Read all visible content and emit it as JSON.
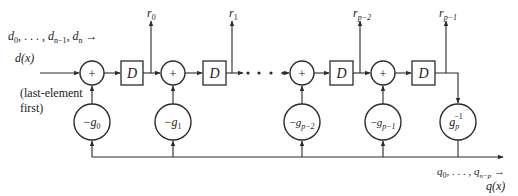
{
  "diagram": {
    "type": "polynomial-division-circuit",
    "input": {
      "sequence_label": "d0, ..., dn−1, dn →",
      "seq": {
        "d0": "d",
        "d0_sub": "0",
        "dots": ", . . . , ",
        "dn1": "d",
        "dn1_sub": "n−1",
        "comma": ", ",
        "dn": "d",
        "dn_sub": "n",
        "arrow": " →"
      },
      "poly_label": "d(x)",
      "note_line1": "(last-element",
      "note_line2": "first)"
    },
    "adders": [
      {
        "symbol": "+"
      },
      {
        "symbol": "+"
      },
      {
        "symbol": "+"
      },
      {
        "symbol": "+"
      }
    ],
    "delays": [
      {
        "symbol": "D"
      },
      {
        "symbol": "D"
      },
      {
        "symbol": "D"
      },
      {
        "symbol": "D"
      }
    ],
    "outputs": [
      {
        "base": "r",
        "sub": "0"
      },
      {
        "base": "r",
        "sub": "1"
      },
      {
        "base": "r",
        "sub": "p−2"
      },
      {
        "base": "r",
        "sub": "p−1"
      }
    ],
    "multipliers": [
      {
        "prefix": "−",
        "base": "g",
        "sub": "0",
        "sup": ""
      },
      {
        "prefix": "−",
        "base": "g",
        "sub": "1",
        "sup": ""
      },
      {
        "prefix": "−",
        "base": "g",
        "sub": "p−2",
        "sup": ""
      },
      {
        "prefix": "−",
        "base": "g",
        "sub": "p−1",
        "sup": ""
      },
      {
        "prefix": "",
        "base": "g",
        "sub": "p",
        "sup": "−1"
      }
    ],
    "ellipsis": "• • • •",
    "output": {
      "q0": "q",
      "q0_sub": "0",
      "dots": ", . . . , ",
      "qn": "q",
      "qn_sub": "n−p",
      "arrow": " →",
      "poly_label": "q(x)"
    }
  }
}
